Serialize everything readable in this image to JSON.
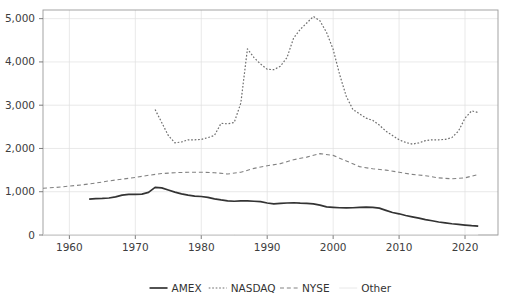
{
  "chart_data": {
    "type": "line",
    "title": "",
    "xlabel": "",
    "ylabel": "",
    "xlim": [
      1956,
      2025
    ],
    "ylim": [
      0,
      5200
    ],
    "grid": true,
    "legend_position": "bottom",
    "x_ticks": [
      "1960",
      "1970",
      "1980",
      "1990",
      "2000",
      "2010",
      "2020"
    ],
    "x_tick_values": [
      1960,
      1970,
      1980,
      1990,
      2000,
      2010,
      2020
    ],
    "y_ticks": [
      "0",
      "1,000",
      "2,000",
      "3,000",
      "4,000",
      "5,000"
    ],
    "y_tick_values": [
      0,
      1000,
      2000,
      3000,
      4000,
      5000
    ],
    "series": [
      {
        "name": "AMEX",
        "style": "solid",
        "color": "#333333",
        "width": 1.7,
        "x": [
          1963,
          1964,
          1965,
          1966,
          1967,
          1968,
          1969,
          1970,
          1971,
          1972,
          1973,
          1974,
          1975,
          1976,
          1977,
          1978,
          1979,
          1980,
          1981,
          1982,
          1983,
          1984,
          1985,
          1986,
          1987,
          1988,
          1989,
          1990,
          1991,
          1992,
          1993,
          1994,
          1995,
          1996,
          1997,
          1998,
          1999,
          2000,
          2001,
          2002,
          2003,
          2004,
          2005,
          2006,
          2007,
          2008,
          2009,
          2010,
          2011,
          2012,
          2013,
          2014,
          2015,
          2016,
          2017,
          2018,
          2019,
          2020,
          2021,
          2022
        ],
        "values": [
          830,
          840,
          845,
          855,
          880,
          920,
          940,
          940,
          945,
          985,
          1100,
          1090,
          1040,
          990,
          950,
          920,
          900,
          890,
          870,
          835,
          810,
          790,
          780,
          790,
          790,
          780,
          770,
          740,
          720,
          730,
          740,
          745,
          735,
          730,
          720,
          690,
          650,
          640,
          630,
          625,
          630,
          640,
          645,
          640,
          620,
          570,
          520,
          490,
          450,
          420,
          390,
          355,
          330,
          300,
          280,
          260,
          245,
          230,
          215,
          205
        ]
      },
      {
        "name": "NASDAQ",
        "style": "dotted",
        "color": "#6e6e6e",
        "width": 1.2,
        "x": [
          1973,
          1974,
          1975,
          1976,
          1977,
          1978,
          1979,
          1980,
          1981,
          1982,
          1983,
          1984,
          1985,
          1986,
          1987,
          1988,
          1989,
          1990,
          1991,
          1992,
          1993,
          1994,
          1995,
          1996,
          1997,
          1998,
          1999,
          2000,
          2001,
          2002,
          2003,
          2004,
          2005,
          2006,
          2007,
          2008,
          2009,
          2010,
          2011,
          2012,
          2013,
          2014,
          2015,
          2016,
          2017,
          2018,
          2019,
          2020,
          2021,
          2022
        ],
        "values": [
          2900,
          2600,
          2300,
          2130,
          2150,
          2200,
          2200,
          2210,
          2250,
          2300,
          2580,
          2570,
          2600,
          3050,
          4300,
          4100,
          3950,
          3830,
          3820,
          3900,
          4100,
          4550,
          4750,
          4900,
          5050,
          4950,
          4680,
          4290,
          3700,
          3200,
          2900,
          2800,
          2700,
          2650,
          2540,
          2400,
          2300,
          2200,
          2140,
          2100,
          2130,
          2180,
          2200,
          2200,
          2210,
          2250,
          2400,
          2700,
          2870,
          2830
        ]
      },
      {
        "name": "NYSE",
        "style": "dashed",
        "color": "#828282",
        "width": 1.1,
        "x": [
          1956,
          1958,
          1960,
          1962,
          1964,
          1966,
          1968,
          1970,
          1972,
          1974,
          1976,
          1978,
          1980,
          1982,
          1984,
          1986,
          1988,
          1990,
          1992,
          1994,
          1996,
          1998,
          2000,
          2002,
          2004,
          2006,
          2008,
          2010,
          2012,
          2014,
          2016,
          2018,
          2020,
          2022
        ],
        "values": [
          1080,
          1100,
          1130,
          1160,
          1200,
          1250,
          1290,
          1330,
          1380,
          1420,
          1440,
          1450,
          1450,
          1440,
          1410,
          1450,
          1540,
          1600,
          1650,
          1740,
          1800,
          1880,
          1840,
          1710,
          1580,
          1530,
          1500,
          1450,
          1400,
          1370,
          1320,
          1300,
          1320,
          1400
        ]
      },
      {
        "name": "Other",
        "style": "solid",
        "color": "#e8e8e8",
        "width": 1.0,
        "x": [
          1956,
          1970,
          1985,
          2000,
          2010,
          2022
        ],
        "values": [
          5,
          5,
          5,
          6,
          6,
          6
        ]
      }
    ]
  },
  "legend": {
    "items": [
      {
        "label": "AMEX"
      },
      {
        "label": "NASDAQ"
      },
      {
        "label": "NYSE"
      },
      {
        "label": "Other"
      }
    ]
  }
}
